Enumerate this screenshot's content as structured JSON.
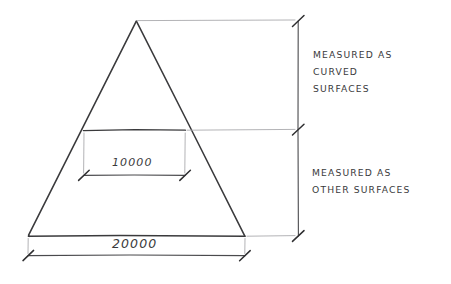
{
  "drawing": {
    "title": "Pyramid surface measurement dimension sketch",
    "style": "hand-drawn technical sketch",
    "background_color": "#ffffff",
    "ink_color": "#3a3a3c",
    "light_ink_color": "#9a9a9e"
  },
  "shape": {
    "name": "triangle",
    "apex": {
      "x": 136,
      "y": 21
    },
    "base_left": {
      "x": 28,
      "y": 236
    },
    "base_right": {
      "x": 245,
      "y": 236
    },
    "chord": {
      "y": 130,
      "x_left": 83,
      "x_right": 185
    }
  },
  "dimensions": {
    "inner": {
      "label": "10000",
      "line_y": 175,
      "x_left": 83,
      "x_right": 185
    },
    "base": {
      "label": "20000",
      "line_y": 255,
      "x_left": 28,
      "x_right": 245
    },
    "vertical_line_x": 298,
    "tick_positions_y": [
      21,
      130,
      236
    ]
  },
  "annotations": [
    {
      "id": "curved",
      "lines": [
        "MEASURED AS",
        "CURVED",
        "SURFACES"
      ],
      "region": "upper"
    },
    {
      "id": "other",
      "lines": [
        "MEASURED AS",
        "OTHER SURFACES"
      ],
      "region": "lower"
    }
  ]
}
